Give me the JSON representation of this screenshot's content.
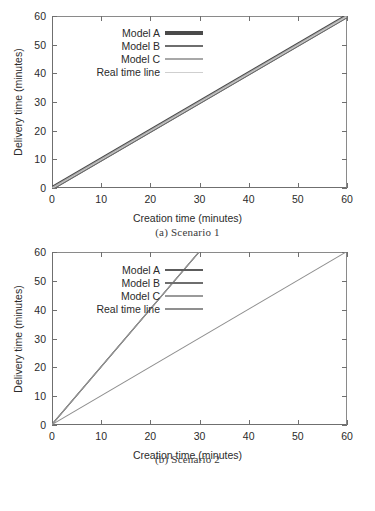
{
  "figure": {
    "panels": [
      {
        "id": "scenario-1",
        "subcaption": "(a) Scenario 1",
        "chart_data": {
          "type": "line",
          "title": "",
          "xlabel": "Creation time (minutes)",
          "ylabel": "Delivery time (minutes)",
          "xlim": [
            0,
            60
          ],
          "ylim": [
            0,
            60
          ],
          "xticks": [
            "0",
            "10",
            "20",
            "30",
            "40",
            "50",
            "60"
          ],
          "yticks": [
            "0",
            "10",
            "20",
            "30",
            "40",
            "50",
            "60"
          ],
          "grid": false,
          "legend_position": "upper-left-inside",
          "series": [
            {
              "name": "Model A",
              "color": "#4a4a4a",
              "width": 4,
              "x": [
                0,
                60
              ],
              "values": [
                0,
                60
              ]
            },
            {
              "name": "Model B",
              "color": "#6e6e6e",
              "width": 2.5,
              "x": [
                0,
                60
              ],
              "values": [
                0,
                60
              ]
            },
            {
              "name": "Model C",
              "color": "#a8a8a8",
              "width": 1.2,
              "x": [
                0,
                60
              ],
              "values": [
                0,
                60
              ]
            },
            {
              "name": "Real time line",
              "color": "#cfcfcf",
              "width": 1,
              "x": [
                0,
                60
              ],
              "values": [
                0,
                60
              ]
            }
          ]
        }
      },
      {
        "id": "scenario-2",
        "subcaption": "(b) Scenario 2",
        "chart_data": {
          "type": "line",
          "title": "",
          "xlabel": "Creation time (minutes)",
          "ylabel": "Delivery time (minutes)",
          "xlim": [
            0,
            60
          ],
          "ylim": [
            0,
            60
          ],
          "xticks": [
            "0",
            "10",
            "20",
            "30",
            "40",
            "50",
            "60"
          ],
          "yticks": [
            "0",
            "10",
            "20",
            "30",
            "40",
            "50",
            "60"
          ],
          "grid": false,
          "legend_position": "upper-left-inside",
          "series": [
            {
              "name": "Model A",
              "color": "#5c5c5c",
              "width": 1.4,
              "x": [
                0,
                30
              ],
              "values": [
                0,
                60
              ]
            },
            {
              "name": "Model B",
              "color": "#6e6e6e",
              "width": 1.4,
              "x": [
                0,
                30
              ],
              "values": [
                0,
                60
              ]
            },
            {
              "name": "Model C",
              "color": "#9a9a9a",
              "width": 1.2,
              "x": [
                0,
                30
              ],
              "values": [
                0,
                60
              ]
            },
            {
              "name": "Real time line",
              "color": "#8f8f8f",
              "width": 1.2,
              "x": [
                0,
                60
              ],
              "values": [
                0,
                60
              ]
            }
          ]
        }
      }
    ]
  }
}
